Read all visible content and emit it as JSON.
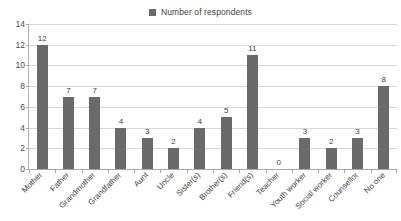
{
  "legend": {
    "entries": [
      {
        "label": "Number of respondents",
        "color": "#6a6a6a",
        "marker": "square-swatch"
      }
    ],
    "position": "top-center"
  },
  "axes": {
    "y_ticks": [
      "0",
      "2",
      "4",
      "6",
      "8",
      "10",
      "12",
      "14"
    ],
    "x_labels": [
      "Mother",
      "Father",
      "Grandmother",
      "Grandfather",
      "Aunt",
      "Uncle",
      "Sister(s)",
      "Brother(s)",
      "Friend(s)",
      "Teacher",
      "Youth worker",
      "Social worker",
      "Counsellor",
      "No one"
    ]
  },
  "chart_data": {
    "type": "bar",
    "title": "",
    "subtitle": "",
    "xlabel": "",
    "ylabel": "",
    "ylim": [
      0,
      14
    ],
    "ytick_step": 2,
    "grid": true,
    "legend_position": "top-center",
    "bar_color": "#6a6a6a",
    "categories": [
      "Mother",
      "Father",
      "Grandmother",
      "Grandfather",
      "Aunt",
      "Uncle",
      "Sister(s)",
      "Brother(s)",
      "Friend(s)",
      "Teacher",
      "Youth worker",
      "Social worker",
      "Counsellor",
      "No one"
    ],
    "series": [
      {
        "name": "Number of respondents",
        "values": [
          12,
          7,
          7,
          4,
          3,
          2,
          4,
          5,
          11,
          0,
          3,
          2,
          3,
          8
        ]
      }
    ],
    "data_labels": [
      "12",
      "7",
      "7",
      "4",
      "3",
      "2",
      "4",
      "5",
      "11",
      "0",
      "3",
      "2",
      "3",
      "8"
    ]
  }
}
